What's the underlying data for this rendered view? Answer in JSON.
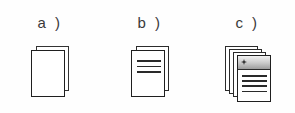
{
  "figure": {
    "background_color": "#ffffff",
    "outline_color": "#1f1f1f",
    "accent_gray": "#9c9c9c",
    "width": 295,
    "height": 113,
    "panels": [
      {
        "id": "a",
        "label": "a )",
        "icon_name": "blank-documents-icon",
        "description": "two stacked blank document sheets",
        "sheet_count": 2,
        "content_line_count": 0,
        "has_header_band": false
      },
      {
        "id": "b",
        "label": "b )",
        "icon_name": "text-documents-icon",
        "description": "two stacked document sheets with text lines",
        "sheet_count": 2,
        "content_line_count": 3,
        "has_header_band": false
      },
      {
        "id": "c",
        "label": "c )",
        "icon_name": "document-stack-with-header-icon",
        "description": "four stacked document sheets, front sheet has shaded header band with marker and text lines",
        "sheet_count": 4,
        "content_line_count": 4,
        "has_header_band": true,
        "header_marker": "diamond-marker"
      }
    ]
  }
}
